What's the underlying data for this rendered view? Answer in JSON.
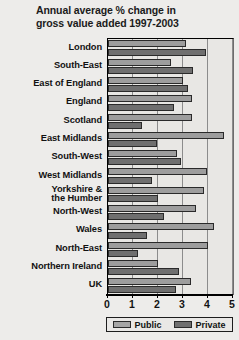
{
  "title": {
    "line1": "Annual average % change in",
    "line2": "gross value added 1997-2003"
  },
  "legend": {
    "position": "bottom",
    "items": [
      {
        "label": "Public",
        "color": "#a6a6a6"
      },
      {
        "label": "Private",
        "color": "#6f6f6f"
      }
    ]
  },
  "axis": {
    "ticks": [
      "0",
      "1",
      "2",
      "3",
      "4",
      "5"
    ]
  },
  "chart_data": {
    "type": "bar",
    "orientation": "horizontal",
    "title": "Annual average % change in gross value added 1997-2003",
    "xlabel": "",
    "ylabel": "",
    "xlim": [
      0,
      5
    ],
    "grid": true,
    "legend_position": "bottom",
    "categories": [
      "London",
      "South-East",
      "East of England",
      "England",
      "Scotland",
      "East Midlands",
      "South-West",
      "West Midlands",
      "Yorkshire &\nthe Humber",
      "North-West",
      "Wales",
      "North-East",
      "Northern Ireland",
      "UK"
    ],
    "series": [
      {
        "name": "Public",
        "color": "#9d9d9d",
        "values": [
          3.1,
          2.5,
          3.0,
          3.35,
          3.35,
          4.65,
          2.75,
          3.95,
          3.85,
          3.5,
          4.25,
          4.0,
          2.0,
          3.3
        ]
      },
      {
        "name": "Private",
        "color": "#6f6f6f",
        "values": [
          3.9,
          3.4,
          3.2,
          2.65,
          1.35,
          1.95,
          2.9,
          1.75,
          2.0,
          2.25,
          1.55,
          1.2,
          2.85,
          2.7
        ]
      }
    ]
  }
}
